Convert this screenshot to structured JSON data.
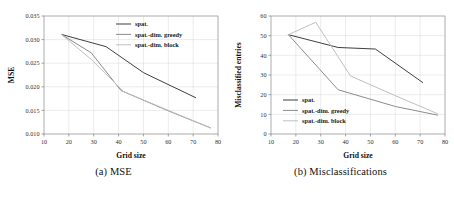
{
  "figure": {
    "panels": [
      {
        "caption": "(a) MSE",
        "name": "mse-panel"
      },
      {
        "caption": "(b) Misclassifications",
        "name": "misclassifications-panel"
      }
    ]
  },
  "colors": {
    "spat": "#3f3f3f",
    "greedy": "#8c8c8c",
    "block": "#c0c0c0",
    "grid": "#d9d9d9",
    "frame": "#8a8a8a",
    "text": "#1a1a1a"
  },
  "chart_data": [
    {
      "type": "line",
      "name": "mse-chart",
      "title": "(a) MSE",
      "xlabel": "Grid size",
      "ylabel": "MSE",
      "xlim": [
        10,
        80
      ],
      "ylim": [
        0.01,
        0.035
      ],
      "xticks": [
        10,
        20,
        30,
        40,
        50,
        60,
        70,
        80
      ],
      "yticks": [
        0.01,
        0.015,
        0.02,
        0.025,
        0.03,
        0.035
      ],
      "ytick_labels": [
        "0.010",
        "0.015",
        "0.020",
        "0.025",
        "0.030",
        "0.035"
      ],
      "grid": true,
      "legend_position": "upper right",
      "series": [
        {
          "name": "spat.",
          "color": "#3f3f3f",
          "x": [
            17,
            35,
            50,
            71
          ],
          "y": [
            0.0311,
            0.0285,
            0.023,
            0.0177
          ]
        },
        {
          "name": "spat.-dim. greedy",
          "color": "#8c8c8c",
          "x": [
            17,
            29,
            41,
            60,
            77
          ],
          "y": [
            0.0311,
            0.0272,
            0.0192,
            0.0149,
            0.0113
          ]
        },
        {
          "name": "spat.-dim. block",
          "color": "#c0c0c0",
          "x": [
            17,
            29,
            42,
            60,
            77
          ],
          "y": [
            0.0311,
            0.0258,
            0.019,
            0.015,
            0.0113
          ]
        }
      ]
    },
    {
      "type": "line",
      "name": "misclassifications-chart",
      "title": "(b) Misclassifications",
      "xlabel": "Grid size",
      "ylabel": "Misclassified entries",
      "xlim": [
        10,
        80
      ],
      "ylim": [
        0,
        60
      ],
      "xticks": [
        10,
        20,
        30,
        40,
        50,
        60,
        70,
        80
      ],
      "yticks": [
        0,
        10,
        20,
        30,
        40,
        50,
        60
      ],
      "ytick_labels": [
        "0",
        "10",
        "20",
        "30",
        "40",
        "50",
        "60"
      ],
      "grid": true,
      "legend_position": "lower left",
      "series": [
        {
          "name": "spat.",
          "color": "#3f3f3f",
          "x": [
            17,
            37,
            52,
            71
          ],
          "y": [
            50.5,
            44.0,
            43.2,
            26.2
          ]
        },
        {
          "name": "spat.-dim. greedy",
          "color": "#8c8c8c",
          "x": [
            17,
            37,
            60,
            77
          ],
          "y": [
            50.5,
            22.5,
            14.0,
            9.6
          ]
        },
        {
          "name": "spat.-dim. block",
          "color": "#c0c0c0",
          "x": [
            17,
            28,
            42,
            60,
            77
          ],
          "y": [
            50.5,
            56.8,
            29.5,
            19.5,
            10.3
          ]
        }
      ]
    }
  ],
  "legend": {
    "entries": [
      {
        "label": "spat.",
        "color": "#3f3f3f"
      },
      {
        "label": "spat.-dim. greedy",
        "color": "#8c8c8c"
      },
      {
        "label": "spat.-dim. block",
        "color": "#c0c0c0"
      }
    ]
  }
}
